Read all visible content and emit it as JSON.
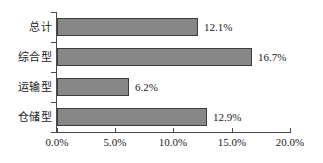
{
  "chart_data": {
    "type": "bar",
    "orientation": "horizontal",
    "title": "",
    "xlabel": "",
    "ylabel": "",
    "categories": [
      "总计",
      "综合型",
      "运输型",
      "仓储型"
    ],
    "values": [
      12.1,
      16.7,
      6.2,
      12.9
    ],
    "data_labels": [
      "12.1%",
      "16.7%",
      "6.2%",
      "12.9%"
    ],
    "xlim": [
      0,
      20
    ],
    "xticks": [
      0,
      5,
      10,
      15,
      20
    ],
    "xtick_labels": [
      "0.0%",
      "5.0%",
      "10.0%",
      "15.0%",
      "20.0%"
    ],
    "grid": false,
    "legend": false,
    "bar_color": "#878787",
    "bar_border_color": "#3d3d3d",
    "axis_color": "#4a4a4a",
    "background": "#ffffff"
  }
}
